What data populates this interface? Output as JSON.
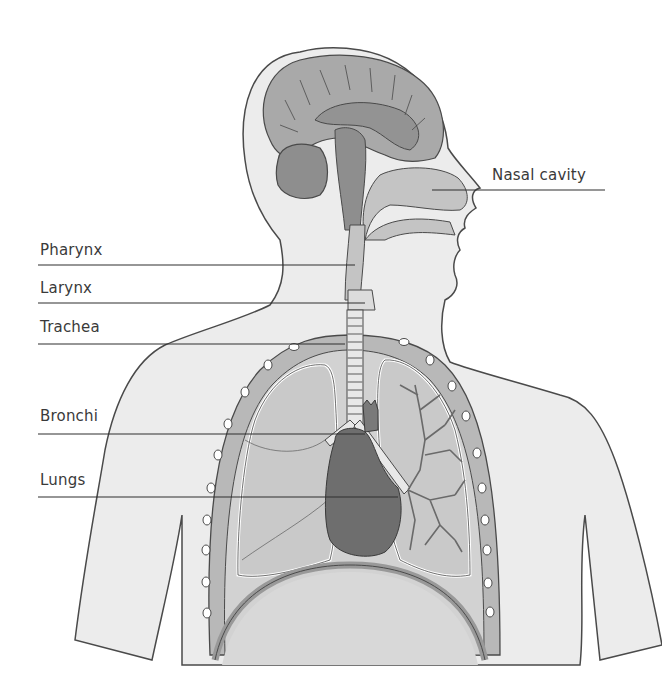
{
  "diagram": {
    "colors": {
      "background": "#ffffff",
      "skin": "#ececec",
      "outline": "#4a4a4a",
      "brain": "#a9a9a9",
      "brain_dark": "#8e8e8e",
      "airway": "#c4c4c4",
      "lung": "#cfcfcf",
      "heart": "#6e6e6e",
      "rib": "#b8b8b8",
      "label_text": "#3a3a3a"
    },
    "labels": [
      {
        "id": "nasal-cavity",
        "text": "Nasal cavity",
        "x": 492,
        "y": 168,
        "line": {
          "x1": 432,
          "y1": 190,
          "x2": 605,
          "y2": 190
        }
      },
      {
        "id": "pharynx",
        "text": "Pharynx",
        "x": 40,
        "y": 243,
        "line": {
          "x1": 38,
          "y1": 265,
          "x2": 355,
          "y2": 265
        }
      },
      {
        "id": "larynx",
        "text": "Larynx",
        "x": 40,
        "y": 281,
        "line": {
          "x1": 38,
          "y1": 303,
          "x2": 365,
          "y2": 303
        }
      },
      {
        "id": "trachea",
        "text": "Trachea",
        "x": 40,
        "y": 320,
        "line": {
          "x1": 38,
          "y1": 344,
          "x2": 345,
          "y2": 344
        }
      },
      {
        "id": "bronchi",
        "text": "Bronchi",
        "x": 40,
        "y": 409,
        "line": {
          "x1": 38,
          "y1": 434,
          "x2": 365,
          "y2": 434
        }
      },
      {
        "id": "lungs",
        "text": "Lungs",
        "x": 40,
        "y": 473,
        "line": {
          "x1": 38,
          "y1": 497,
          "x2": 398,
          "y2": 497
        }
      }
    ]
  }
}
